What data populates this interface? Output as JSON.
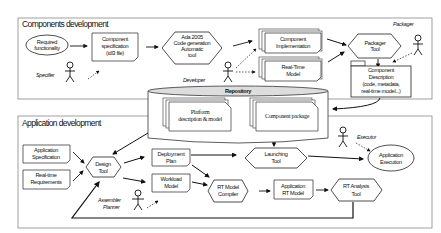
{
  "sections": {
    "components": {
      "title": "Components development"
    },
    "application": {
      "title": "Application development"
    }
  },
  "repository": {
    "label": "Repository",
    "items": [
      {
        "line1": "Platform",
        "line2": "description & model"
      },
      {
        "line1": "Component package"
      }
    ]
  },
  "components_nodes": {
    "required": {
      "line1": "Required",
      "line2": "functionality"
    },
    "spec": {
      "line1": "Component",
      "line2": "specification",
      "line3": "(idl3 file)"
    },
    "ada": {
      "line1": "Ada 2005",
      "line2": "Code generation",
      "line3": "Automatic",
      "line4": "tool"
    },
    "impl": {
      "line1": "Component",
      "line2": "Implementation"
    },
    "rtmodel": {
      "line1": "Real-Time",
      "line2": "Model"
    },
    "packager_tool": {
      "line1": "Packager",
      "line2": "Tool"
    },
    "comp_desc": {
      "line1": "Component",
      "line2": "Description",
      "line3": "(code, metadata,",
      "line4": "real-time model...)"
    }
  },
  "application_nodes": {
    "app_spec": {
      "line1": "Application",
      "line2": "Specification"
    },
    "rt_req": {
      "line1": "Real-time",
      "line2": "Requirements"
    },
    "design": {
      "line1": "Design",
      "line2": "Tool"
    },
    "deploy": {
      "line1": "Deployment",
      "line2": "Plan"
    },
    "workload": {
      "line1": "Workload",
      "line2": "Model"
    },
    "launch": {
      "line1": "Launching",
      "line2": "Tool"
    },
    "exec": {
      "line1": "Application",
      "line2": "Execution"
    },
    "compiler": {
      "line1": "RT Model",
      "line2": "Compiler"
    },
    "app_rt": {
      "line1": "Application",
      "line2": "RT Model"
    },
    "analysis": {
      "line1": "RT Analysis",
      "line2": "Tool"
    }
  },
  "actors": {
    "specifier": "Specifier",
    "developer": "Developer",
    "packager": "Packager",
    "executor": "Executor",
    "assembler_line1": "Assembler",
    "assembler_line2": "Planner"
  }
}
